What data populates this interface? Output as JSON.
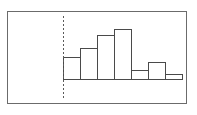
{
  "figure": {
    "title": "",
    "frame": {
      "x": 7,
      "y": 11,
      "width": 180,
      "height": 93,
      "border_color": "#6b6b6b"
    },
    "baseline_y": 79,
    "axis_color": "#4a4a4a",
    "bar_fill": "#ffffff",
    "reference_line": {
      "name": "dotted-reference-line",
      "x": 63,
      "y_top": 16,
      "y_bottom": 100,
      "style": "dotted",
      "color": "#5a5a5a"
    }
  },
  "chart_data": {
    "type": "bar",
    "title": "",
    "xlabel": "",
    "ylabel": "",
    "grid": false,
    "legend": null,
    "categories": [
      "1",
      "2",
      "3",
      "4",
      "5",
      "6",
      "7"
    ],
    "values": [
      22,
      31,
      44,
      50,
      9,
      17,
      5
    ],
    "ylim": [
      0,
      68
    ],
    "bar_pixel_geometry": [
      {
        "index": 0,
        "left": 63,
        "right": 80,
        "top": 57
      },
      {
        "index": 1,
        "left": 80,
        "right": 97,
        "top": 48
      },
      {
        "index": 2,
        "left": 97,
        "right": 114,
        "top": 35
      },
      {
        "index": 3,
        "left": 114,
        "right": 131,
        "top": 29
      },
      {
        "index": 4,
        "left": 131,
        "right": 148,
        "top": 70
      },
      {
        "index": 5,
        "left": 148,
        "right": 165,
        "top": 62
      },
      {
        "index": 6,
        "left": 165,
        "right": 182,
        "top": 74
      }
    ],
    "axis_ticks_x": [
      63,
      80,
      97,
      114,
      131,
      148,
      165,
      182
    ],
    "axis_start_x": 63,
    "axis_end_x": 182
  }
}
